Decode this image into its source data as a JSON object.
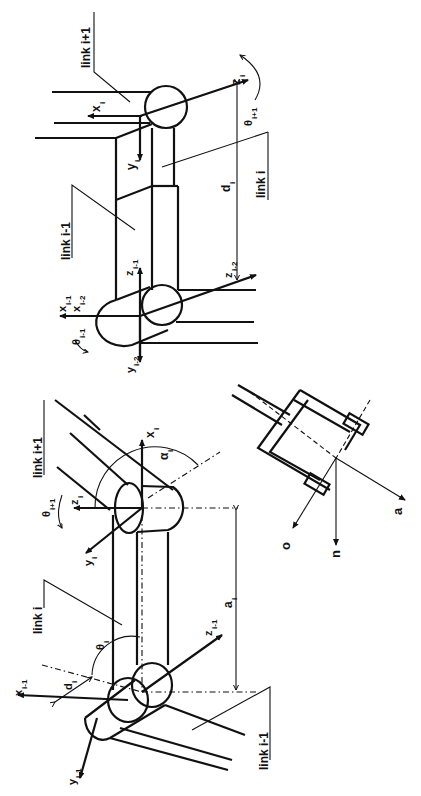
{
  "figure": {
    "orientation": "rotated 90 degrees counter-clockwise",
    "background": "#ffffff",
    "ink_color": "#111111"
  },
  "top_diagram": {
    "name": "prismatic-joint",
    "labels": {
      "link_next": "link i+1",
      "link_curr": "link i",
      "link_prev": "link i-1",
      "x_i": "x",
      "x_i_sub": "i",
      "y_i": "y",
      "y_i_sub": "i",
      "z_i": "z",
      "z_i_sub": "i",
      "theta_next": "θ",
      "theta_next_sub": "i+1",
      "d_i": "d",
      "d_i_sub": "i",
      "z_im1": "z",
      "z_im1_sub": "i-1",
      "z_im2": "z",
      "z_im2_sub": "i-2",
      "x_im1": "x",
      "x_im1_sub": "i-1",
      "x_im2": "x",
      "x_im2_sub": "i-2",
      "theta_prev": "θ",
      "theta_prev_sub": "i-1",
      "y_im2": "y",
      "y_im2_sub": "i-2"
    }
  },
  "bottom_diagram": {
    "name": "revolute-joint",
    "labels": {
      "link_next": "link i+1",
      "link_curr": "link i",
      "link_prev": "link i-1",
      "x_i": "x",
      "x_i_sub": "i",
      "alpha_i": "α",
      "alpha_i_sub": "i",
      "theta_next": "θ",
      "theta_next_sub": "i+1",
      "z_i": "z",
      "z_i_sub": "i",
      "y_i": "y",
      "y_i_sub": "i",
      "a_i": "a",
      "a_i_sub": "i",
      "z_im1": "z",
      "z_im1_sub": "i-1",
      "theta_i": "θ",
      "theta_i_sub": "i",
      "d_i": "d",
      "d_i_sub": "i",
      "x_im1": "x",
      "x_im1_sub": "i-1",
      "y_im1": "y",
      "y_im1_sub": "i-1"
    }
  },
  "gripper": {
    "name": "end-effector-gripper",
    "labels": {
      "o": "o",
      "n": "n",
      "a": "a"
    }
  }
}
